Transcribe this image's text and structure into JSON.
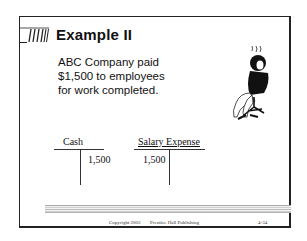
{
  "slide": {
    "title": "Example II",
    "body_lines": [
      "ABC Company paid",
      "$1,500 to employees",
      "for work completed."
    ],
    "t_accounts": [
      {
        "name": "Cash",
        "debit": "",
        "credit": "1,500"
      },
      {
        "name": "Salary Expense",
        "debit": "1,500",
        "credit": ""
      }
    ],
    "footer": {
      "copyright": "Copyright 2003",
      "publisher": "Prentice Hall Publishing",
      "page": "4-34"
    },
    "icons": {
      "logo": "striped-logo-icon",
      "clipart": "person-in-chair-icon"
    }
  }
}
